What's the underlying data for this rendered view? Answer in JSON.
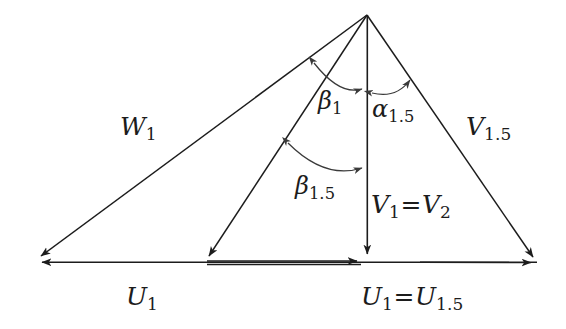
{
  "figure": {
    "type": "velocity-triangle-vector-diagram",
    "background_color": "#ffffff",
    "stroke_color": "#1c1c1c",
    "arc_color": "#3a3a3a"
  },
  "labels": {
    "w1": {
      "base": "W",
      "sub": "1"
    },
    "v15": {
      "base": "V",
      "sub": "1.5"
    },
    "beta1": {
      "base": "β",
      "sub": "1"
    },
    "alpha15": {
      "base": "α",
      "sub": "1.5"
    },
    "beta15": {
      "base": "β",
      "sub": "1.5"
    },
    "v1v2": {
      "base": "V",
      "sub": "1",
      "eq": "=",
      "base2": "V",
      "sub2": "2"
    },
    "u1": {
      "base": "U",
      "sub": "1"
    },
    "u1u15": {
      "base": "U",
      "sub": "1",
      "eq": "=",
      "base2": "U",
      "sub2": "1.5"
    }
  },
  "geometry": {
    "apex": {
      "x": 367,
      "y": 14
    },
    "baseline_y": 262,
    "left_tip": {
      "x": 34,
      "y": 262
    },
    "mid_vertex": {
      "x": 205,
      "y": 262
    },
    "center_vertex": {
      "x": 367,
      "y": 262
    },
    "right_tip": {
      "x": 537,
      "y": 263
    },
    "vectors": [
      {
        "name": "W1",
        "from": "apex",
        "to": "left_tip",
        "arrow": "end"
      },
      {
        "name": "W1.5",
        "from": "apex",
        "to": "mid_vertex",
        "arrow": "end"
      },
      {
        "name": "V1=V2",
        "from": "apex",
        "to": "center_vertex",
        "arrow": "end"
      },
      {
        "name": "V1.5",
        "from": "apex",
        "to": "right_tip",
        "arrow": "end"
      },
      {
        "name": "U1",
        "from": "left_tip",
        "to": "right_tip",
        "arrow": "end"
      },
      {
        "name": "U1=U1.5",
        "from": "mid_vertex",
        "to": "center_vertex",
        "arrow": "end"
      }
    ],
    "angle_arcs": [
      {
        "name": "beta1",
        "between": [
          "W1",
          "V1"
        ],
        "double_headed": true
      },
      {
        "name": "alpha15",
        "between": [
          "V1",
          "V1.5"
        ],
        "double_headed": true
      },
      {
        "name": "beta15",
        "between": [
          "W1.5",
          "V1"
        ],
        "double_headed": true
      }
    ]
  }
}
